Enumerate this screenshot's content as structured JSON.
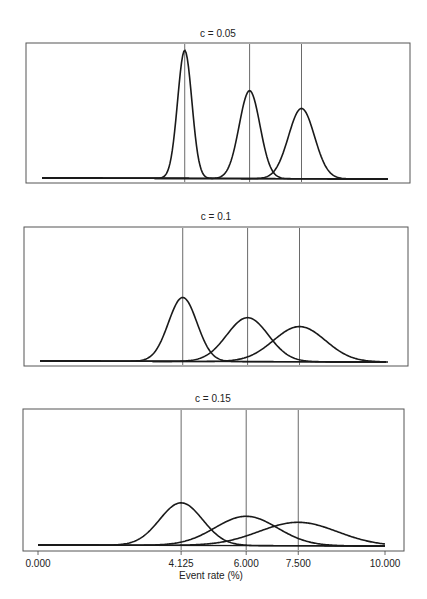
{
  "chart_data": {
    "type": "line",
    "xlabel": "Event rate (%)",
    "x_ticks": [
      0.0,
      4.125,
      6.0,
      7.5,
      10.0
    ],
    "x_tick_labels": [
      "0.000",
      "4.125",
      "6.000",
      "7.500",
      "10.000"
    ],
    "xlim": [
      0,
      10
    ],
    "grid": false,
    "vertical_reference_lines": [
      4.125,
      6.0,
      7.5
    ],
    "panels": [
      {
        "title": "c = 0.05",
        "c": 0.05,
        "series": [
          {
            "name": "mean 4.125",
            "mean": 4.125,
            "sd": 0.206
          },
          {
            "name": "mean 6.000",
            "mean": 6.0,
            "sd": 0.3
          },
          {
            "name": "mean 7.500",
            "mean": 7.5,
            "sd": 0.375
          }
        ]
      },
      {
        "title": "c = 0.1",
        "c": 0.1,
        "series": [
          {
            "name": "mean 4.125",
            "mean": 4.125,
            "sd": 0.4125
          },
          {
            "name": "mean 6.000",
            "mean": 6.0,
            "sd": 0.6
          },
          {
            "name": "mean 7.500",
            "mean": 7.5,
            "sd": 0.75
          }
        ]
      },
      {
        "title": "c = 0.15",
        "c": 0.15,
        "series": [
          {
            "name": "mean 4.125",
            "mean": 4.125,
            "sd": 0.619
          },
          {
            "name": "mean 6.000",
            "mean": 6.0,
            "sd": 0.9
          },
          {
            "name": "mean 7.500",
            "mean": 7.5,
            "sd": 1.125
          }
        ]
      }
    ]
  }
}
